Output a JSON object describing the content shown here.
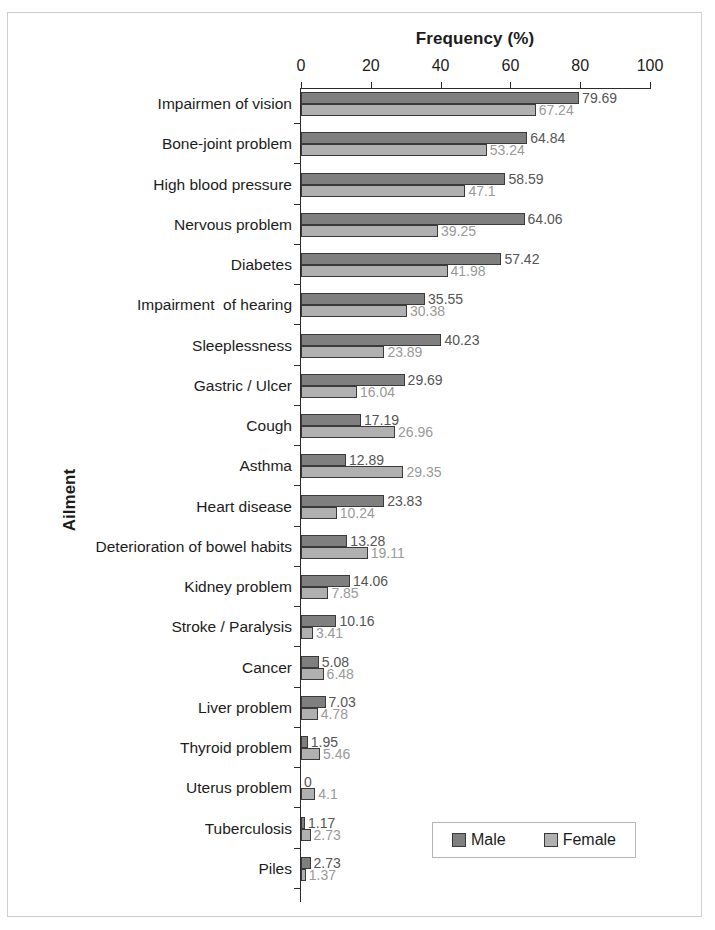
{
  "chart_data": {
    "type": "bar",
    "orientation": "horizontal",
    "title": "Frequency (%)",
    "xlabel": "Frequency (%)",
    "ylabel": "Ailment",
    "xlim": [
      0,
      100
    ],
    "xticks": [
      0,
      20,
      40,
      60,
      80,
      100
    ],
    "xtick_labels": [
      "0",
      "20",
      "40",
      "60",
      "80",
      "100"
    ],
    "grid": false,
    "legend_position": "bottom-right",
    "categories": [
      "Impairmen of vision",
      "Bone-joint problem",
      "High blood pressure",
      "Nervous problem",
      "Diabetes",
      "Impairment  of hearing",
      "Sleeplessness",
      "Gastric / Ulcer",
      "Cough",
      "Asthma",
      "Heart disease",
      "Deterioration of bowel habits",
      "Kidney problem",
      "Stroke / Paralysis",
      "Cancer",
      "Liver problem",
      "Thyroid problem",
      "Uterus problem",
      "Tuberculosis",
      "Piles"
    ],
    "series": [
      {
        "name": "Male",
        "color": "#7f7f7f",
        "values": [
          79.69,
          64.84,
          58.59,
          64.06,
          57.42,
          35.55,
          40.23,
          29.69,
          17.19,
          12.89,
          23.83,
          13.28,
          14.06,
          10.16,
          5.08,
          7.03,
          1.95,
          0,
          1.17,
          2.73
        ],
        "labels": [
          "79.69",
          "64.84",
          "58.59",
          "64.06",
          "57.42",
          "35.55",
          "40.23",
          "29.69",
          "17.19",
          "12.89",
          "23.83",
          "13.28",
          "14.06",
          "10.16",
          "5.08",
          "7.03",
          "1.95",
          "0",
          "1.17",
          "2.73"
        ]
      },
      {
        "name": "Female",
        "color": "#b0b0b0",
        "values": [
          67.24,
          53.24,
          47.1,
          39.25,
          41.98,
          30.38,
          23.89,
          16.04,
          26.96,
          29.35,
          10.24,
          19.11,
          7.85,
          3.41,
          6.48,
          4.78,
          5.46,
          4.1,
          2.73,
          1.37
        ],
        "labels": [
          "67.24",
          "53.24",
          "47.1",
          "39.25",
          "41.98",
          "30.38",
          "23.89",
          "16.04",
          "26.96",
          "29.35",
          "10.24",
          "19.11",
          "7.85",
          "3.41",
          "6.48",
          "4.78",
          "5.46",
          "4.1",
          "2.73",
          "1.37"
        ]
      }
    ]
  },
  "legend": {
    "entries": [
      {
        "label": "Male",
        "color": "#7f7f7f"
      },
      {
        "label": "Female",
        "color": "#b0b0b0"
      }
    ]
  }
}
